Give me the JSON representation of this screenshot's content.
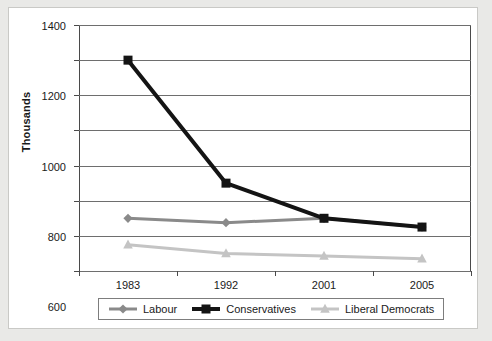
{
  "chart_data": {
    "type": "line",
    "title": "",
    "xlabel": "",
    "ylabel": "Thousands",
    "categories": [
      "1983",
      "1992",
      "2001",
      "2005"
    ],
    "ylim": [
      0,
      1400
    ],
    "yticks": [
      0,
      200,
      400,
      600,
      800,
      1000,
      1200,
      1400
    ],
    "ytick_labels": [
      "0",
      "200",
      "400",
      "600",
      "800",
      "1000",
      "1200",
      "1400"
    ],
    "grid": true,
    "legend_position": "bottom",
    "series": [
      {
        "name": "Labour",
        "values": [
          300,
          275,
          300,
          250
        ],
        "color": "#8a8a8a",
        "marker": "diamond",
        "line_width": 3
      },
      {
        "name": "Conservatives",
        "values": [
          1200,
          500,
          300,
          250
        ],
        "color": "#141414",
        "marker": "square",
        "line_width": 4
      },
      {
        "name": "Liberal Democrats",
        "values": [
          150,
          100,
          85,
          70
        ],
        "color": "#c4c4c4",
        "marker": "triangle",
        "line_width": 3
      }
    ]
  },
  "axis": {
    "y_title": "Thousands"
  },
  "legend": {
    "entries": [
      "Labour",
      "Conservatives",
      "Liberal Democrats"
    ]
  },
  "colors": {
    "labour": "#8a8a8a",
    "conservatives": "#141414",
    "liberal_democrats": "#c4c4c4",
    "axis": "#4a4a4a",
    "gridline": "#6e6e6e",
    "page_background": "#e9e9e7",
    "card_background": "#ffffff"
  }
}
